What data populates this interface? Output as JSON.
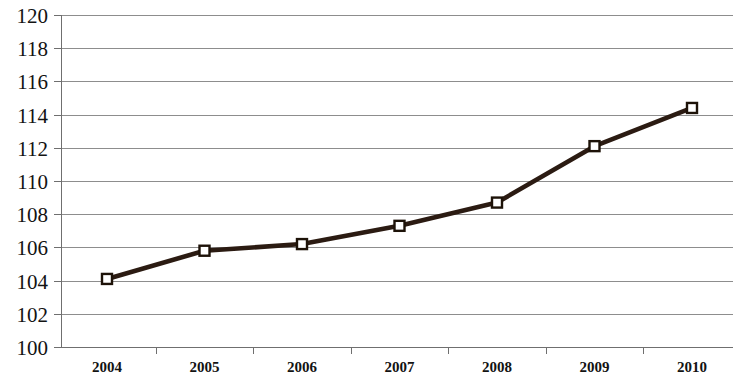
{
  "chart_data": {
    "type": "line",
    "title": "",
    "subtitle": "",
    "xlabel": "",
    "ylabel": "",
    "categories": [
      "2004",
      "2005",
      "2006",
      "2007",
      "2008",
      "2009",
      "2010"
    ],
    "values": [
      104.1,
      105.8,
      106.2,
      107.3,
      108.7,
      112.1,
      114.4
    ],
    "series": [
      {
        "name": "",
        "values": [
          104.1,
          105.8,
          106.2,
          107.3,
          108.7,
          112.1,
          114.4
        ]
      }
    ],
    "ylim": [
      100,
      120
    ],
    "ytick_step": 2,
    "ytick_labels": [
      "100",
      "102",
      "104",
      "106",
      "108",
      "110",
      "112",
      "114",
      "116",
      "118",
      "120"
    ],
    "xtick_labels": [
      "2004",
      "2005",
      "2006",
      "2007",
      "2008",
      "2009",
      "2010"
    ],
    "grid": true,
    "grid_axis": "y",
    "legend": false,
    "legend_position": "none",
    "annotations": [],
    "marker": "square-open",
    "colors": {
      "line": "#2b1b12",
      "marker_fill": "#ffffff",
      "marker_stroke": "#1d1208",
      "gridline": "#8d8d8d",
      "axis": "#6f6f6f",
      "text": "#131313",
      "background": "#ffffff"
    }
  },
  "plot_geometry": {
    "left": 61,
    "right": 733,
    "top": 15,
    "bottom": 347,
    "first_point_x": 107,
    "point_spacing_x": 97.5
  }
}
